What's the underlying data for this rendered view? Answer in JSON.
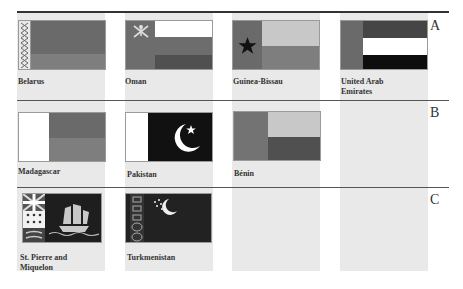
{
  "rows": [
    {
      "letter": "A",
      "flags": [
        {
          "name": "Belarus"
        },
        {
          "name": "Oman"
        },
        {
          "name": "Guinea-Bissau"
        },
        {
          "name": "United Arab Emirates",
          "line1": "United Arab",
          "line2": "Emirates"
        }
      ]
    },
    {
      "letter": "B",
      "flags": [
        {
          "name": "Madagascar"
        },
        {
          "name": "Pakistan"
        },
        {
          "name": "Bénin"
        }
      ]
    },
    {
      "letter": "C",
      "flags": [
        {
          "name": "St. Pierre and Miquelon",
          "line1": "St. Pierre and",
          "line2": "Miquelon"
        },
        {
          "name": "Turkmenistan"
        }
      ]
    }
  ],
  "colors": {
    "red_gray": "#6a6a6a",
    "green_gray": "#808080",
    "dark": "#1a1a1a",
    "light": "#c8c8c8",
    "white": "#ffffff",
    "column_bg": "#e9e9e9"
  }
}
